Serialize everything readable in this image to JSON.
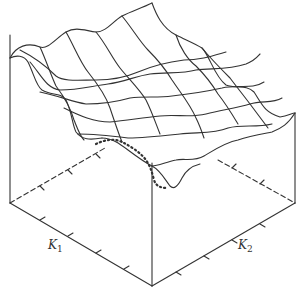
{
  "figure": {
    "type": "3d-surface-plot",
    "colors": {
      "line": "#333333",
      "background": "#ffffff"
    }
  },
  "axes": {
    "k1": {
      "symbol": "K",
      "subscript": "1"
    },
    "k2": {
      "symbol": "K",
      "subscript": "2"
    }
  }
}
